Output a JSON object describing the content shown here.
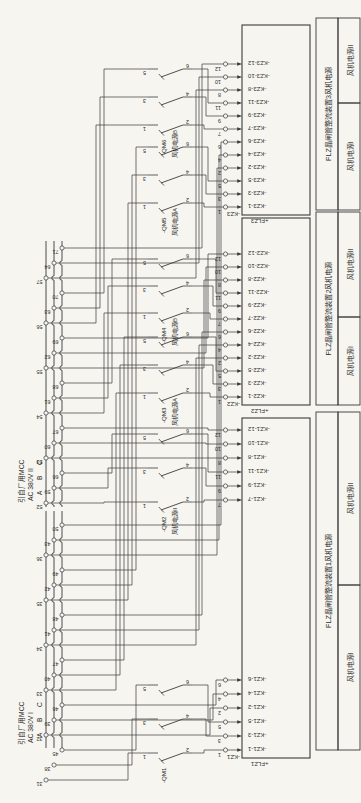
{
  "page": {
    "background": "#f6f5f0",
    "ink": "#3b3b3b",
    "text": "#2e2e2e"
  },
  "diagram": {
    "sources": [
      {
        "name": "引自厂用MCC",
        "voltage": "AC 380V I",
        "phases": [
          "A",
          "B",
          "C"
        ],
        "tap_groups": [
          [
            "31",
            "38",
            "45"
          ],
          [
            "32",
            "39",
            "46"
          ],
          [
            "33",
            "40",
            "47"
          ],
          [
            "34",
            "41",
            "48"
          ],
          [
            "35",
            "42",
            "49"
          ],
          [
            "36",
            "43",
            "50"
          ]
        ]
      },
      {
        "name": "引自厂用MCC",
        "voltage": "AC 380V II",
        "phases": [
          "A",
          "B",
          "C"
        ],
        "tap_groups": [
          [
            "52",
            "59",
            "66"
          ],
          [
            "53",
            "60",
            "67"
          ],
          [
            "54",
            "61",
            "68"
          ],
          [
            "55",
            "62",
            "69"
          ],
          [
            "56",
            "63",
            "70"
          ],
          [
            "57",
            "64",
            "71"
          ]
        ]
      }
    ],
    "switches": [
      {
        "label": "-QM1",
        "sublabel": "",
        "top": [
          "1",
          "3",
          "5"
        ],
        "bottom": [
          "2",
          "4",
          "6"
        ]
      },
      {
        "label": "-QM2",
        "sublabel": "风机电源II",
        "top": [
          "1",
          "3",
          "5"
        ],
        "bottom": [
          "2",
          "4",
          "6"
        ]
      },
      {
        "label": "-QM3",
        "sublabel": "风机电源A",
        "top": [
          "1",
          "3",
          "5"
        ],
        "bottom": [
          "2",
          "4",
          "6"
        ]
      },
      {
        "label": "-QM4",
        "sublabel": "风机电源B",
        "top": [
          "1",
          "3",
          "5"
        ],
        "bottom": [
          "2",
          "4",
          "6"
        ]
      },
      {
        "label": "-QM5",
        "sublabel": "风机电源A",
        "top": [
          "1",
          "3",
          "5"
        ],
        "bottom": [
          "2",
          "4",
          "6"
        ]
      },
      {
        "label": "-QM6",
        "sublabel": "风机电源B",
        "top": [
          "1",
          "3",
          "5"
        ],
        "bottom": [
          "2",
          "4",
          "6"
        ]
      }
    ],
    "devices": [
      {
        "connector": "-KZ1",
        "box": "+FLZ1",
        "title": "FLZ晶闸管整流装置1风机电源",
        "cells": [
          "风机电源I",
          "风机电源II"
        ],
        "pins_a": [
          "1",
          "3",
          "5",
          "2",
          "4",
          "6"
        ],
        "pins_b": [
          "7",
          "9",
          "11",
          "8",
          "10",
          "12"
        ],
        "terms_a": [
          "-KZ1-1",
          "-KZ1-3",
          "-KZ1-5",
          "-KZ1-2",
          "-KZ1-4",
          "-KZ1-6"
        ],
        "terms_b": [
          "-KZ1-7",
          "-KZ1-9",
          "-KZ1-11",
          "-KZ1-8",
          "-KZ1-10",
          "-KZ1-12"
        ]
      },
      {
        "connector": "-KZ2",
        "box": "+FLZ2",
        "title": "FLZ晶闸管整流装置2风机电源",
        "cells": [
          "风机电源I",
          "风机电源II"
        ],
        "pins_a": [
          "1",
          "3",
          "5",
          "2",
          "4",
          "6"
        ],
        "pins_b": [
          "7",
          "9",
          "11",
          "8",
          "10",
          "12"
        ],
        "terms_a": [
          "-KZ2-1",
          "-KZ2-3",
          "-KZ2-5",
          "-KZ2-2",
          "-KZ2-4",
          "-KZ2-6"
        ],
        "terms_b": [
          "-KZ2-7",
          "-KZ2-9",
          "-KZ2-11",
          "-KZ2-8",
          "-KZ2-10",
          "-KZ2-12"
        ]
      },
      {
        "connector": "-KZ3",
        "box": "+FLZ3",
        "title": "FLZ晶闸管整流装置3风机电源",
        "cells": [
          "风机电源I",
          "风机电源II"
        ],
        "pins_a": [
          "1",
          "3",
          "5",
          "2",
          "4",
          "6"
        ],
        "pins_b": [
          "7",
          "9",
          "11",
          "8",
          "10",
          "12"
        ],
        "terms_a": [
          "-KZ3-1",
          "-KZ3-3",
          "-KZ3-5",
          "-KZ3-2",
          "-KZ3-4",
          "-KZ3-6"
        ],
        "terms_b": [
          "-KZ3-7",
          "-KZ3-9",
          "-KZ3-11",
          "-KZ3-8",
          "-KZ3-10",
          "-KZ3-12"
        ]
      }
    ]
  }
}
